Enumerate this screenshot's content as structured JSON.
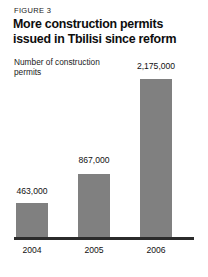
{
  "figure": {
    "kicker": "FIGURE 3",
    "title": "More construction permits issued in Tbilisi since reform",
    "axis_label": "Number of construction permits"
  },
  "colors": {
    "bar": "#808080",
    "baseline": "#2b2b2b",
    "text": "#111111",
    "background": "#ffffff"
  },
  "chart_data": {
    "type": "bar",
    "title": "More construction permits issued in Tbilisi since reform",
    "subtitle": "FIGURE 3",
    "xlabel": "",
    "ylabel": "Number of construction permits",
    "categories": [
      "2004",
      "2005",
      "2006"
    ],
    "values": [
      463000,
      867000,
      2175000
    ],
    "value_labels": [
      "463,000",
      "867,000",
      "2,175,000"
    ],
    "ylim": [
      0,
      2175000
    ],
    "grid": false,
    "legend": false,
    "bar_color": "#808080"
  }
}
